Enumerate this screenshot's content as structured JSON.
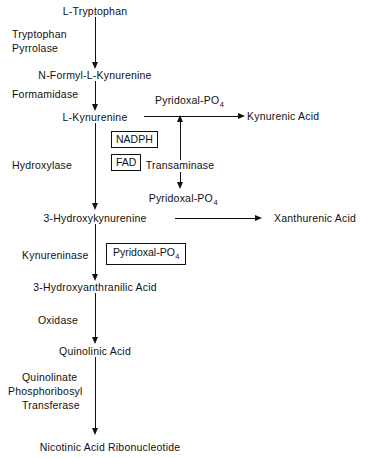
{
  "diagram": {
    "colors": {
      "background": "#ffffff",
      "line": "#111111",
      "text": "#111111"
    },
    "nodes": {
      "tryptophan": "L-Tryptophan",
      "n_formyl_kynurenine": "N-Formyl-L-Kynurenine",
      "kynurenine": "L-Kynurenine",
      "hydroxykynurenine": "3-Hydroxykynurenine",
      "hydroxyanthranilic_acid": "3-Hydroxyanthranilic  Acid",
      "quinolinic_acid": "Quinolinic  Acid",
      "nicotinic_acid_ribonucleotide": "Nicotinic  Acid  Ribonucleotide"
    },
    "enzymes": {
      "tryptophan_pyrrolase_line1": "Tryptophan",
      "tryptophan_pyrrolase_line2": "Pyrrolase",
      "formamidase": "Formamidase",
      "hydroxylase": "Hydroxylase",
      "kynureninase": "Kynureninase",
      "oxidase": "Oxidase",
      "quinolinate_prt_line1": "Quinolinate",
      "quinolinate_prt_line2": "Phosphoribosyl",
      "quinolinate_prt_line3": "Transferase",
      "transaminase": "Transaminase"
    },
    "cofactors": {
      "nadph": "NADPH",
      "fad": "FAD",
      "pyridoxal_po4_boxed_base": "Pyridoxal-PO",
      "pyridoxal_po4_boxed_sub": "4",
      "pyridoxal_po4_top_base": "Pyridoxal-PO",
      "pyridoxal_po4_top_sub": "4",
      "pyridoxal_po4_bottom_base": "Pyridoxal-PO",
      "pyridoxal_po4_bottom_sub": "4"
    },
    "products": {
      "kynurenic_acid": "Kynurenic  Acid",
      "xanthurenic_acid": "Xanthurenic  Acid"
    }
  }
}
